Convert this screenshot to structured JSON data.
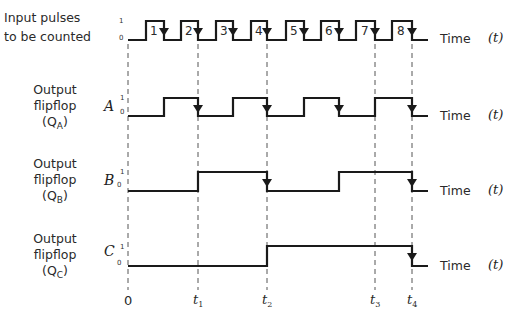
{
  "rows": {
    "input": {
      "label_line1": "Input pulses",
      "label_line2": "to be counted",
      "one": "1",
      "zero": "0",
      "time": "Time",
      "tvar": "(t)"
    },
    "a": {
      "label_line1": "Output",
      "label_line2": "flipflop",
      "label_line3_open": "(Q",
      "label_line3_sub": "A",
      "label_line3_close": ")",
      "letter": "A",
      "one": "1",
      "zero": "0",
      "time": "Time",
      "tvar": "(t)"
    },
    "b": {
      "label_line1": "Output",
      "label_line2": "flipflop",
      "label_line3_open": "(Q",
      "label_line3_sub": "B",
      "label_line3_close": ")",
      "letter": "B",
      "one": "1",
      "zero": "0",
      "time": "Time",
      "tvar": "(t)"
    },
    "c": {
      "label_line1": "Output",
      "label_line2": "flipflop",
      "label_line3_open": "(Q",
      "label_line3_sub": "C",
      "label_line3_close": ")",
      "letter": "C",
      "one": "1",
      "zero": "0",
      "time": "Time",
      "tvar": "(t)"
    }
  },
  "pulse_numbers": [
    "1",
    "2",
    "3",
    "4",
    "5",
    "6",
    "7",
    "8"
  ],
  "time_markers": [
    {
      "label": "0",
      "sub": ""
    },
    {
      "label": "t",
      "sub": "1"
    },
    {
      "label": "t",
      "sub": "2"
    },
    {
      "label": "t",
      "sub": "3"
    },
    {
      "label": "t",
      "sub": "4"
    }
  ],
  "colors": {
    "line": "#1a1a1a",
    "dashed": "#555555",
    "background": "#ffffff"
  }
}
